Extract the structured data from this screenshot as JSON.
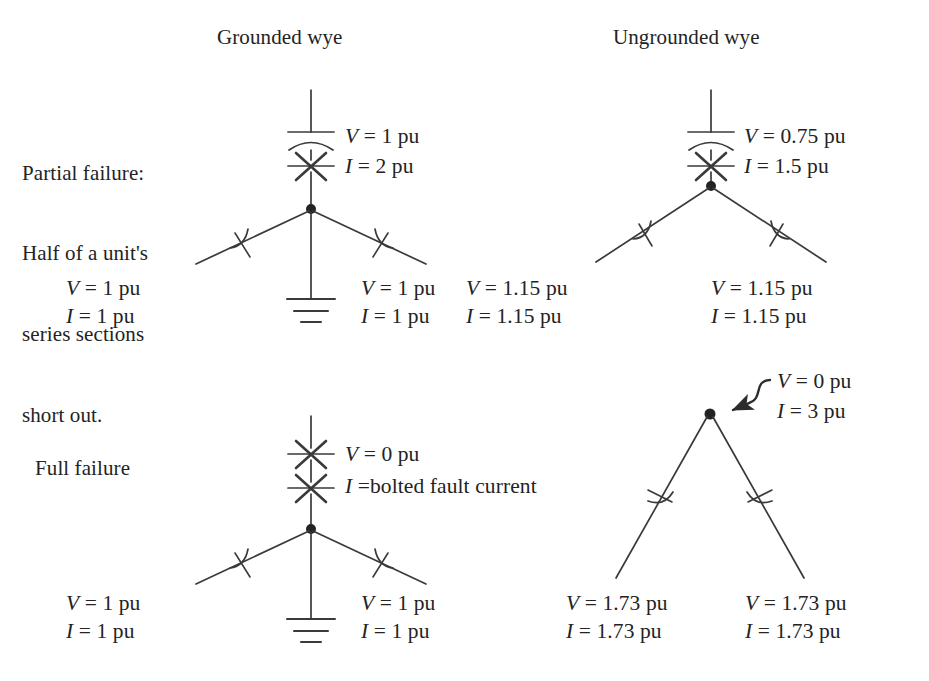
{
  "figure": {
    "type": "schematic-diagram",
    "background_color": "#ffffff",
    "line_color": "#3a3a3a",
    "text_color": "#232323"
  },
  "column_titles": {
    "left": "Grounded wye",
    "right": "Ungrounded wye"
  },
  "row_titles": {
    "partial": "Partial failure:\nHalf of a unit's\nseries sections\nshort out.",
    "partial_lines": [
      "Partial failure:",
      "Half of a unit's",
      "series sections",
      "short out."
    ],
    "full": "Full failure"
  },
  "cells": {
    "partial_grounded": {
      "name": "Partial failure, grounded wye",
      "faulted_branch": {
        "v": "V = 1 pu",
        "i": "I = 2 pu"
      },
      "left_branch": {
        "v": "V = 1 pu",
        "i": "I = 1 pu"
      },
      "right_branch": {
        "v": "V = 1 pu",
        "i": "I = 1 pu"
      },
      "grounded": true,
      "fault_marks": 1,
      "has_capacitor_on_faulted_branch": true
    },
    "partial_ungrounded": {
      "name": "Partial failure, ungrounded wye",
      "faulted_branch": {
        "v": "V = 0.75 pu",
        "i": "I = 1.5 pu"
      },
      "left_branch": {
        "v": "V = 1.15 pu",
        "i": "I = 1.15 pu"
      },
      "right_branch": {
        "v": "V = 1.15 pu",
        "i": "I = 1.15 pu"
      },
      "grounded": false,
      "fault_marks": 1,
      "has_capacitor_on_faulted_branch": true
    },
    "full_grounded": {
      "name": "Full failure, grounded wye",
      "faulted_branch": {
        "v": "V = 0 pu",
        "i": "I =bolted fault current"
      },
      "left_branch": {
        "v": "V = 1 pu",
        "i": "I = 1 pu"
      },
      "right_branch": {
        "v": "V = 1 pu",
        "i": "I = 1 pu"
      },
      "grounded": true,
      "fault_marks": 2,
      "has_capacitor_on_faulted_branch": false
    },
    "full_ungrounded": {
      "name": "Full failure, ungrounded wye",
      "node_callout": {
        "v": "V = 0 pu",
        "i": "I = 3 pu",
        "arrow": "curved-arrow-pointing-to-neutral-node"
      },
      "left_branch": {
        "v": "V = 1.73 pu",
        "i": "I = 1.73 pu"
      },
      "right_branch": {
        "v": "V = 1.73 pu",
        "i": "I = 1.73 pu"
      },
      "grounded": false,
      "fault_marks": 0,
      "has_capacitor_on_faulted_branch": false
    }
  },
  "symbols": {
    "capacitor": "capacitor-symbol",
    "fault": "fault-x-symbol",
    "ground": "ground-symbol",
    "node": "junction-node-dot",
    "callout_arrow": "callout-arrow-icon"
  }
}
